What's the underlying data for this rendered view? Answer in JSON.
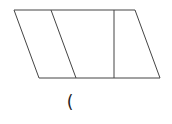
{
  "diagram": {
    "shape": "parallelogram",
    "stroke_color": "#444444",
    "outer": {
      "points": "14,10 135,10 160,78 39,78"
    },
    "slanted_divider": {
      "x1": 51,
      "y1": 10,
      "x2": 76,
      "y2": 78
    },
    "vertical_divider": {
      "x1": 114,
      "y1": 10,
      "x2": 114,
      "y2": 78
    },
    "caption": "("
  }
}
